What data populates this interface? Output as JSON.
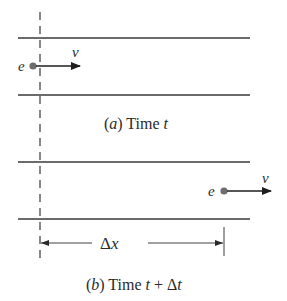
{
  "diagram": {
    "panel_a": {
      "caption_prefix": "(",
      "caption_letter": "a",
      "caption_suffix": ") Time ",
      "caption_var": "t",
      "particle_label": "e",
      "velocity_label": "v"
    },
    "panel_b": {
      "caption_prefix": "(",
      "caption_letter": "b",
      "caption_suffix": ") Time ",
      "caption_var": "t",
      "caption_plus": " + Δ",
      "caption_var2": "t",
      "particle_label": "e",
      "velocity_label": "v",
      "displacement_delta": "Δ",
      "displacement_var": "x"
    },
    "colors": {
      "line": "#3a3a3a",
      "particle": "#6e6e6e",
      "text": "#2a2a2a"
    }
  }
}
